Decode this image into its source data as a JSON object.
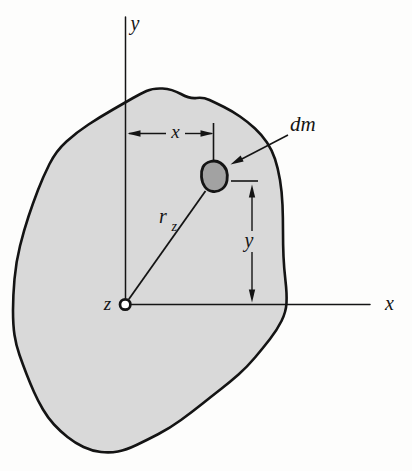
{
  "figure": {
    "labels": {
      "y_axis": "y",
      "x_axis": "x",
      "origin": "z",
      "mass_element": "dm",
      "radius": "r",
      "radius_sub": "z",
      "dim_x": "x",
      "dim_y": "y"
    },
    "colors": {
      "background": "#fdfdfc",
      "body_fill": "#d9d9d9",
      "mass_fill": "#a2a2a2",
      "line": "#141414"
    }
  }
}
